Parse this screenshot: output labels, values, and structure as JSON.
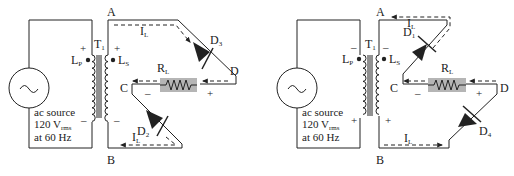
{
  "circuits": [
    {
      "id": "left",
      "description": "Bridge rectifier, positive half-cycle: current flows through D3 and D2",
      "source": {
        "line1": "ac source",
        "line2_main": "120 V",
        "line2_sub": "rms",
        "line3": "at 60 Hz",
        "symbol": "sine-wave"
      },
      "transformer": {
        "label_main": "T",
        "label_sub": "1",
        "primary_main": "L",
        "primary_sub": "P",
        "secondary_main": "L",
        "secondary_sub": "S",
        "primary_top_polarity": "+",
        "primary_bottom_polarity": "–",
        "secondary_top_polarity": "+",
        "secondary_bottom_polarity": "–"
      },
      "nodes": {
        "A": "A",
        "B": "B",
        "C": "C",
        "D": "D"
      },
      "diodes": [
        {
          "main": "D",
          "sub": "3"
        },
        {
          "main": "D",
          "sub": "2"
        }
      ],
      "resistor": {
        "main": "R",
        "sub": "L",
        "minus": "–",
        "plus": "+"
      },
      "current_labels": [
        {
          "main": "I",
          "sub": "L"
        },
        {
          "main": "I",
          "sub": "L"
        }
      ]
    },
    {
      "id": "right",
      "description": "Bridge rectifier, negative half-cycle: current flows through D4 and D1",
      "source": {
        "line1": "ac source",
        "line2_main": "120 V",
        "line2_sub": "rms",
        "line3": "at 60 Hz",
        "symbol": "sine-wave"
      },
      "transformer": {
        "label_main": "T",
        "label_sub": "1",
        "primary_main": "L",
        "primary_sub": "P",
        "secondary_main": "L",
        "secondary_sub": "S",
        "primary_top_polarity": "–",
        "primary_bottom_polarity": "+",
        "secondary_top_polarity": "–",
        "secondary_bottom_polarity": "+"
      },
      "nodes": {
        "A": "A",
        "B": "B",
        "C": "C",
        "D": "D"
      },
      "diodes": [
        {
          "main": "D",
          "sub": "1"
        },
        {
          "main": "D",
          "sub": "4"
        }
      ],
      "resistor": {
        "main": "R",
        "sub": "L",
        "minus": "–",
        "plus": "+"
      },
      "current_labels": [
        {
          "main": "I",
          "sub": "L"
        },
        {
          "main": "I",
          "sub": "L"
        }
      ]
    }
  ]
}
